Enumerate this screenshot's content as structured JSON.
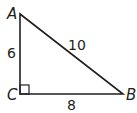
{
  "diagram": {
    "type": "right-triangle",
    "stroke_color": "#231f20",
    "vertices": [
      {
        "name": "A",
        "label": "A"
      },
      {
        "name": "B",
        "label": "B"
      },
      {
        "name": "C",
        "label": "C"
      }
    ],
    "sides": [
      {
        "name": "AC",
        "label": "6"
      },
      {
        "name": "AB",
        "label": "10"
      },
      {
        "name": "CB",
        "label": "8"
      }
    ],
    "right_angle_at": "C"
  }
}
